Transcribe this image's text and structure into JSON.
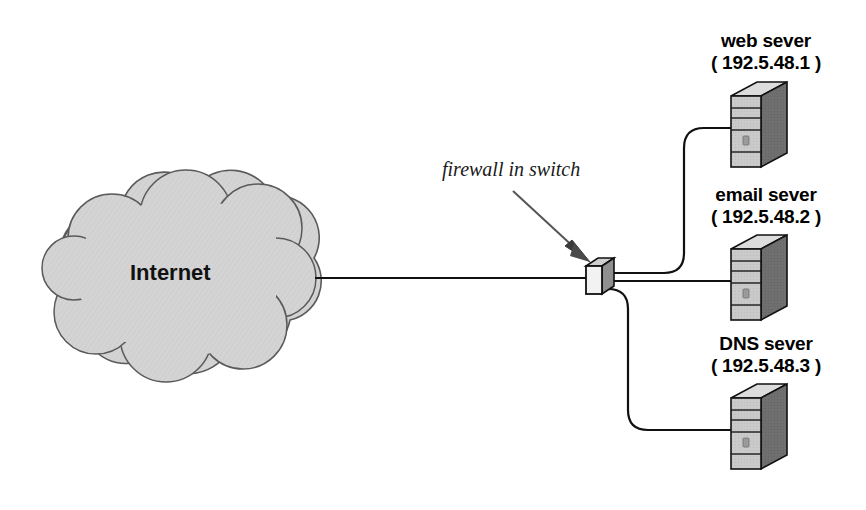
{
  "diagram": {
    "background_color": "#ffffff",
    "cloud": {
      "label": "Internet",
      "fill_color": "#d4d4d4",
      "stroke_color": "#4a4a4a"
    },
    "annotation": {
      "text": "firewall in switch",
      "arrow": "points down-right to switch"
    },
    "switch": {
      "name": "firewall switch",
      "fill_color": "#e8e8e8",
      "stroke_color": "#111111"
    },
    "servers": [
      {
        "id": "web",
        "name": "web sever",
        "ip": "( 192.5.48.1 )",
        "front_color": "#c9c9c9",
        "side_color": "#6f6f6f",
        "top_color": "#dcdcdc"
      },
      {
        "id": "email",
        "name": "email sever",
        "ip": "( 192.5.48.2 )",
        "front_color": "#c9c9c9",
        "side_color": "#6f6f6f",
        "top_color": "#dcdcdc"
      },
      {
        "id": "dns",
        "name": "DNS sever",
        "ip": "( 192.5.48.3 )",
        "front_color": "#c9c9c9",
        "side_color": "#6f6f6f",
        "top_color": "#dcdcdc"
      }
    ],
    "links": [
      {
        "from": "Internet",
        "to": "firewall switch"
      },
      {
        "from": "firewall switch",
        "to": "web sever"
      },
      {
        "from": "firewall switch",
        "to": "email sever"
      },
      {
        "from": "firewall switch",
        "to": "DNS sever"
      }
    ],
    "scan_artifacts": {
      "line_a": "             ",
      "line_b": "                       "
    }
  }
}
